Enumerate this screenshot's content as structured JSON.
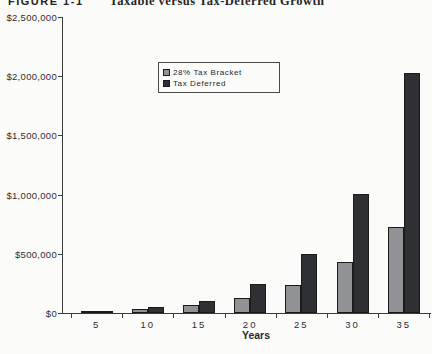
{
  "heading": {
    "label": "FIGURE 1-1",
    "title": "Taxable versus Tax-Deferred Growth"
  },
  "chart_data": {
    "type": "bar",
    "title": "Taxable versus Tax-Deferred Growth",
    "xlabel": "Years",
    "ylabel": "",
    "categories": [
      "5",
      "10",
      "15",
      "20",
      "25",
      "30",
      "35"
    ],
    "series": [
      {
        "name": "28% Tax Bracket",
        "color": "#909296",
        "values": [
          13000,
          35000,
          67000,
          125000,
          235000,
          430000,
          725000
        ]
      },
      {
        "name": "Tax Deferred",
        "color": "#2e3033",
        "values": [
          16000,
          48000,
          105000,
          245000,
          500000,
          1005000,
          2030000
        ]
      }
    ],
    "ylim": [
      0,
      2500000
    ],
    "ytick_step": 500000,
    "ytick_labels": [
      "$0",
      "$500,000",
      "$1,000,000",
      "$1,500,000",
      "$2,000,000",
      "$2,500,000"
    ],
    "grid": false,
    "legend_position": "upper-left-inside"
  }
}
